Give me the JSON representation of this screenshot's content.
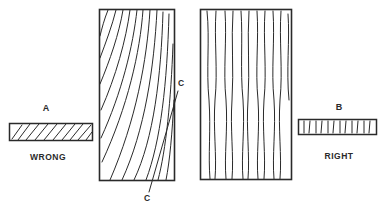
{
  "diagram": {
    "ink_color": "#2a2a2a",
    "background": "#ffffff",
    "board_a": {
      "letter": "A",
      "verdict": "WRONG"
    },
    "board_b": {
      "letter": "B",
      "verdict": "RIGHT"
    },
    "panel_left": {
      "grain": "curved, slanted (flat-sawn face)"
    },
    "panel_right": {
      "grain": "straight, vertical (quarter-sawn face)"
    },
    "callout": {
      "top_label": "C",
      "bottom_label": "C"
    }
  }
}
